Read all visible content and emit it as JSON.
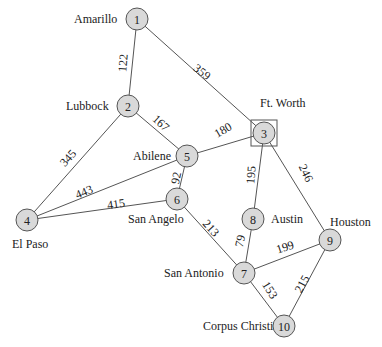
{
  "nodes": [
    {
      "id": "1",
      "city": "Amarillo",
      "x": 137,
      "y": 19,
      "lx": 74,
      "ly": 23,
      "anchor": "start"
    },
    {
      "id": "2",
      "city": "Lubbock",
      "x": 128,
      "y": 106,
      "lx": 66,
      "ly": 110,
      "anchor": "start"
    },
    {
      "id": "3",
      "city": "Ft. Worth",
      "x": 264,
      "y": 133,
      "lx": 260,
      "ly": 107,
      "anchor": "start"
    },
    {
      "id": "4",
      "city": "El Paso",
      "x": 27,
      "y": 220,
      "lx": 12,
      "ly": 248,
      "anchor": "start"
    },
    {
      "id": "5",
      "city": "Abilene",
      "x": 187,
      "y": 156,
      "lx": 133,
      "ly": 160,
      "anchor": "start"
    },
    {
      "id": "6",
      "city": "San Angelo",
      "x": 177,
      "y": 199,
      "lx": 128,
      "ly": 223,
      "anchor": "start"
    },
    {
      "id": "7",
      "city": "San Antonio",
      "x": 244,
      "y": 273,
      "lx": 164,
      "ly": 277,
      "anchor": "start"
    },
    {
      "id": "8",
      "city": "Austin",
      "x": 253,
      "y": 219,
      "lx": 271,
      "ly": 223,
      "anchor": "start"
    },
    {
      "id": "9",
      "city": "Houston",
      "x": 330,
      "y": 240,
      "lx": 330,
      "ly": 226,
      "anchor": "start"
    },
    {
      "id": "10",
      "city": "Corpus Christi",
      "x": 284,
      "y": 326,
      "lx": 203,
      "ly": 330,
      "anchor": "start"
    }
  ],
  "edges": [
    {
      "from": "1",
      "to": "2",
      "weight": "122",
      "wx": 123,
      "wy": 63,
      "rot": -86
    },
    {
      "from": "1",
      "to": "3",
      "weight": "359",
      "wx": 202,
      "wy": 72,
      "rot": 38
    },
    {
      "from": "2",
      "to": "5",
      "weight": "167",
      "wx": 161,
      "wy": 123,
      "rot": 42
    },
    {
      "from": "2",
      "to": "4",
      "weight": "345",
      "wx": 68,
      "wy": 158,
      "rot": -48
    },
    {
      "from": "3",
      "to": "5",
      "weight": "180",
      "wx": 223,
      "wy": 130,
      "rot": -30
    },
    {
      "from": "3",
      "to": "8",
      "weight": "195",
      "wx": 251,
      "wy": 175,
      "rot": -86
    },
    {
      "from": "3",
      "to": "9",
      "weight": "246",
      "wx": 306,
      "wy": 173,
      "rot": 65
    },
    {
      "from": "5",
      "to": "4",
      "weight": "443",
      "wx": 84,
      "wy": 192,
      "rot": -22
    },
    {
      "from": "5",
      "to": "6",
      "weight": "92",
      "wx": 176,
      "wy": 178,
      "rot": -78
    },
    {
      "from": "6",
      "to": "4",
      "weight": "415",
      "wx": 116,
      "wy": 204,
      "rot": -8
    },
    {
      "from": "6",
      "to": "7",
      "weight": "213",
      "wx": 211,
      "wy": 228,
      "rot": 48
    },
    {
      "from": "8",
      "to": "7",
      "weight": "79",
      "wx": 240,
      "wy": 241,
      "rot": -78
    },
    {
      "from": "7",
      "to": "9",
      "weight": "199",
      "wx": 285,
      "wy": 247,
      "rot": -18
    },
    {
      "from": "7",
      "to": "10",
      "weight": "153",
      "wx": 270,
      "wy": 290,
      "rot": 58
    },
    {
      "from": "10",
      "to": "9",
      "weight": "215",
      "wx": 302,
      "wy": 284,
      "rot": -62
    }
  ],
  "highlighted_node": "3",
  "colors": {
    "node_fill": "#d9d9d9",
    "stroke": "#555555",
    "text": "#222222"
  }
}
